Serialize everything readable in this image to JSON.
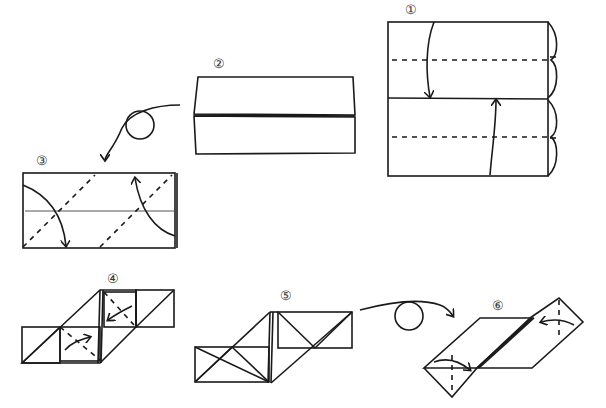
{
  "diagram": {
    "colors": {
      "paper_colored": "#a8a8a8",
      "paper_white": "#ffffff",
      "line": "#1a1a1a"
    },
    "steps": [
      {
        "id": 1,
        "label": "①",
        "description": "Colored square; fold top and bottom edges to center line (valley folds), brackets indicate equal halves"
      },
      {
        "id": 2,
        "label": "②",
        "description": "Folded rectangle with two flaps meeting at center"
      },
      {
        "id": 3,
        "label": "③",
        "description": "Turned over; fold corners diagonally along dashed lines"
      },
      {
        "id": 4,
        "label": "④",
        "description": "Parallelogram shape; fold inner flaps"
      },
      {
        "id": 5,
        "label": "⑤",
        "description": "Colored triangles shown at both ends"
      },
      {
        "id": 6,
        "label": "⑥",
        "description": "Turned over; fold tips along dashed lines"
      }
    ],
    "symbols": {
      "turn_over_1": "turn-over-arrow",
      "turn_over_2": "turn-over-arrow"
    }
  }
}
